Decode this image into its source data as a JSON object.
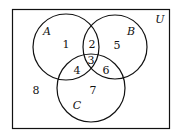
{
  "diagram": {
    "type": "venn",
    "universe_label": "U",
    "sets": [
      {
        "name": "A",
        "cx": 66,
        "cy": 47,
        "r": 33
      },
      {
        "name": "B",
        "cx": 115,
        "cy": 47,
        "r": 32
      },
      {
        "name": "C",
        "cx": 91,
        "cy": 88,
        "r": 34
      }
    ],
    "regions": [
      {
        "label": "1",
        "x": 66,
        "y": 48
      },
      {
        "label": "2",
        "x": 92,
        "y": 47
      },
      {
        "label": "3",
        "x": 91,
        "y": 63
      },
      {
        "label": "4",
        "x": 77,
        "y": 74
      },
      {
        "label": "5",
        "x": 117,
        "y": 49
      },
      {
        "label": "6",
        "x": 106,
        "y": 74
      },
      {
        "label": "7",
        "x": 93,
        "y": 93
      },
      {
        "label": "8",
        "x": 36,
        "y": 93
      }
    ],
    "set_labels": [
      {
        "label": "A",
        "x": 47,
        "y": 35
      },
      {
        "label": "B",
        "x": 131,
        "y": 35
      },
      {
        "label": "C",
        "x": 77,
        "y": 109
      }
    ],
    "universe_label_pos": {
      "x": 160,
      "y": 23
    }
  }
}
